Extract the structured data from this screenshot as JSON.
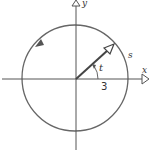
{
  "diagram": {
    "type": "unit-circle-angle",
    "labels": {
      "x_axis": "x",
      "y_axis": "y",
      "angle": "t",
      "arc_length": "s",
      "radius": "3"
    },
    "colors": {
      "stroke": "#555555",
      "background": "#ffffff"
    }
  }
}
